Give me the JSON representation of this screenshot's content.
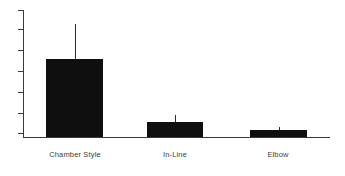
{
  "chart_data": {
    "type": "bar",
    "title": "",
    "subtitle": "",
    "xlabel": "",
    "ylabel": "",
    "categories": [
      "Chamber Style",
      "In-Line",
      "Elbow"
    ],
    "values": [
      0.61,
      0.12,
      0.055
    ],
    "errors_upper": [
      0.27,
      0.055,
      0.025
    ],
    "series": [
      {
        "name": "",
        "values": [
          0.61,
          0.12,
          0.055
        ]
      }
    ],
    "ylim": [
      0,
      1.0
    ],
    "y_tick_count": 7,
    "y_tick_labels": [
      "",
      "",
      "",
      "",
      "",
      "",
      ""
    ],
    "x_tick_labels": [
      "Chamber Style",
      "In-Line",
      "Elbow"
    ],
    "grid": false,
    "legend": false,
    "legend_position": "none",
    "error_bars": "upper-only",
    "bar_color": "#100f0f",
    "axis_color": "#3a3a3a",
    "label_color": "#3d3d3d",
    "background": "#ffffff"
  },
  "axes": {
    "y_ticks": [
      {
        "pos_pct": 0
      },
      {
        "pos_pct": 15
      },
      {
        "pos_pct": 31.5
      },
      {
        "pos_pct": 48
      },
      {
        "pos_pct": 64.5
      },
      {
        "pos_pct": 81
      },
      {
        "pos_pct": 97
      }
    ]
  },
  "bars": [
    {
      "label": "Chamber Style",
      "left_px": 46,
      "width_px": 57,
      "height_px": 78,
      "err_top_px": 24,
      "err_bottom_px": 59,
      "label_left_px": 40,
      "label_width_px": 70
    },
    {
      "label": "In-Line",
      "left_px": 147,
      "width_px": 56,
      "height_px": 15,
      "err_top_px": 115,
      "err_bottom_px": 122,
      "label_left_px": 145,
      "label_width_px": 60
    },
    {
      "label": "Elbow",
      "left_px": 250,
      "width_px": 57,
      "height_px": 7,
      "err_top_px": 127,
      "err_bottom_px": 130,
      "label_left_px": 248,
      "label_width_px": 60
    }
  ]
}
